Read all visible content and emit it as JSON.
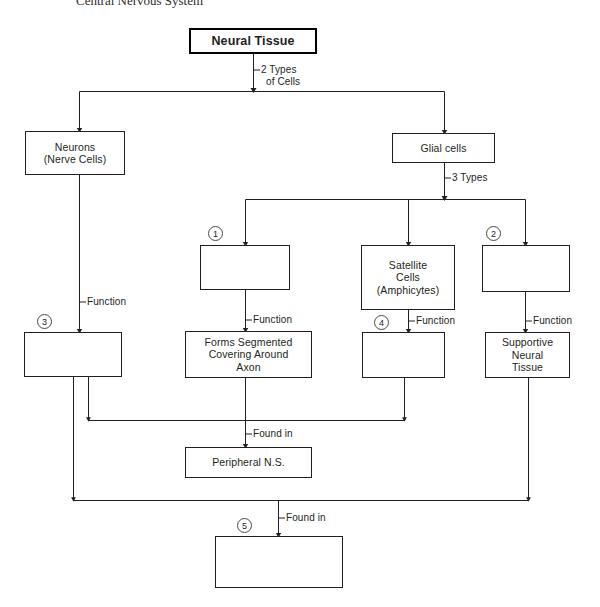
{
  "heading": {
    "text": "Central Nervous System"
  },
  "diagram": {
    "line_color": "#231f20",
    "nodes": {
      "root": "Neural Tissue",
      "neurons": "Neurons\n(Nerve Cells)",
      "neurons_line1": "Neurons",
      "neurons_line2": "(Nerve Cells)",
      "glial": "Glial cells",
      "blank1": "",
      "satellite_line1": "Satellite",
      "satellite_line2": "Cells",
      "satellite_line3": "(Amphicytes)",
      "blank2": "",
      "blank3": "",
      "myelin_line1": "Forms Segmented",
      "myelin_line2": "Covering Around",
      "myelin_line3": "Axon",
      "blank4": "",
      "supportive_line1": "Supportive",
      "supportive_line2": "Neural",
      "supportive_line3": "Tissue",
      "peripheral": "Peripheral N.S.",
      "blank5": ""
    },
    "edge_labels": {
      "two_types_line1": "2 Types",
      "two_types_line2": "of Cells",
      "three_types": "3 Types",
      "function_neurons": "Function",
      "function_1": "Function",
      "function_satellite": "Function",
      "function_2": "Function",
      "found_in_peripheral": "Found in",
      "found_in_bottom": "Found in"
    },
    "markers": {
      "m1": "1",
      "m2": "2",
      "m3": "3",
      "m4": "4",
      "m5": "5"
    }
  }
}
